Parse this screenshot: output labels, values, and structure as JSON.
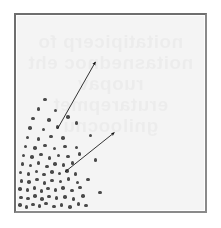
{
  "figure": {
    "caption": "",
    "background_color": "#f4f4f4",
    "frame_color": "#6e6e6e",
    "dot_color": "#4a4a4a",
    "arrow_color": "#111111",
    "page_color": "#ffffff"
  },
  "bleed_text": {
    "line1": "noitatipicerp fo",
    "line2": "noitasnednoc eht",
    "line3": "ruopav",
    "line4": "erutarepmet",
    "line5": "gniloocnu"
  },
  "chart_data": {
    "type": "scatter",
    "title": "",
    "xlabel": "",
    "ylabel": "",
    "xlim": [
      0,
      100
    ],
    "ylim": [
      0,
      100
    ],
    "grid": false,
    "legend": "none",
    "dot_radius_px": 1.8,
    "points": [
      [
        2.0,
        3.0
      ],
      [
        5.5,
        2.2
      ],
      [
        9.0,
        3.4
      ],
      [
        12.5,
        2.6
      ],
      [
        16.0,
        3.8
      ],
      [
        20.0,
        2.4
      ],
      [
        24.0,
        3.2
      ],
      [
        28.5,
        2.0
      ],
      [
        33.0,
        3.6
      ],
      [
        37.0,
        2.8
      ],
      [
        2.6,
        7.0
      ],
      [
        6.2,
        6.4
      ],
      [
        10.0,
        7.6
      ],
      [
        13.8,
        6.0
      ],
      [
        17.4,
        7.4
      ],
      [
        21.5,
        6.6
      ],
      [
        25.8,
        7.2
      ],
      [
        30.5,
        6.2
      ],
      [
        35.5,
        7.8
      ],
      [
        2.2,
        11.2
      ],
      [
        6.0,
        10.6
      ],
      [
        9.8,
        11.8
      ],
      [
        13.4,
        10.2
      ],
      [
        17.0,
        11.4
      ],
      [
        21.0,
        10.8
      ],
      [
        25.0,
        11.6
      ],
      [
        29.5,
        10.4
      ],
      [
        34.0,
        12.0
      ],
      [
        3.0,
        15.4
      ],
      [
        7.0,
        14.8
      ],
      [
        11.0,
        16.0
      ],
      [
        15.0,
        14.4
      ],
      [
        19.2,
        15.6
      ],
      [
        23.5,
        15.0
      ],
      [
        27.8,
        16.2
      ],
      [
        32.5,
        14.6
      ],
      [
        2.4,
        19.6
      ],
      [
        6.6,
        19.0
      ],
      [
        10.8,
        20.2
      ],
      [
        14.8,
        18.6
      ],
      [
        19.0,
        19.8
      ],
      [
        23.0,
        19.2
      ],
      [
        27.0,
        20.4
      ],
      [
        31.5,
        18.8
      ],
      [
        3.4,
        24.0
      ],
      [
        7.6,
        23.2
      ],
      [
        12.0,
        24.4
      ],
      [
        16.4,
        22.8
      ],
      [
        20.6,
        24.0
      ],
      [
        25.2,
        23.4
      ],
      [
        30.0,
        24.6
      ],
      [
        4.0,
        28.4
      ],
      [
        8.6,
        27.6
      ],
      [
        13.2,
        28.8
      ],
      [
        17.8,
        27.2
      ],
      [
        22.4,
        28.4
      ],
      [
        27.6,
        27.8
      ],
      [
        33.5,
        29.0
      ],
      [
        5.0,
        33.0
      ],
      [
        10.0,
        32.2
      ],
      [
        15.2,
        33.4
      ],
      [
        20.4,
        31.8
      ],
      [
        26.0,
        33.0
      ],
      [
        32.0,
        32.4
      ],
      [
        6.0,
        37.6
      ],
      [
        12.0,
        36.8
      ],
      [
        18.5,
        38.0
      ],
      [
        25.0,
        37.2
      ],
      [
        7.5,
        42.4
      ],
      [
        14.5,
        41.6
      ],
      [
        22.0,
        42.8
      ],
      [
        9.0,
        47.2
      ],
      [
        17.5,
        46.4
      ],
      [
        27.5,
        48.0
      ],
      [
        12.0,
        52.0
      ],
      [
        21.0,
        51.2
      ],
      [
        15.5,
        57.0
      ],
      [
        32.0,
        45.0
      ],
      [
        39.5,
        38.5
      ],
      [
        42.0,
        26.0
      ],
      [
        38.0,
        16.0
      ],
      [
        44.5,
        9.5
      ]
    ],
    "arrows": [
      {
        "name": "upper-arrow",
        "from": [
          22.0,
          42.0
        ],
        "to": [
          42.0,
          76.0
        ],
        "angle_deg": 59,
        "label": ""
      },
      {
        "name": "lower-arrow",
        "from": [
          26.0,
          20.0
        ],
        "to": [
          52.0,
          40.0
        ],
        "angle_deg": 33,
        "label": ""
      }
    ]
  }
}
